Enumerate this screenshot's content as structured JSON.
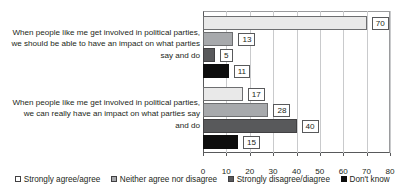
{
  "chart_data": {
    "type": "bar",
    "orientation": "horizontal",
    "title": "",
    "xlabel": "",
    "ylabel": "",
    "xlim": [
      0,
      80
    ],
    "xticks": [
      0,
      10,
      20,
      30,
      40,
      50,
      60,
      70,
      80
    ],
    "grid": true,
    "legend_position": "bottom",
    "categories": [
      "When people like me get involved in political parties, we should be able to have an impact on what parties say and do",
      "When people like me get involved in political parties, we can really have an impact on what parties say and do"
    ],
    "series": [
      {
        "name": "Strongly agree/agree",
        "color": "#e9e9e9",
        "values": [
          70,
          17
        ]
      },
      {
        "name": "Neither agree nor disagree",
        "color": "#a7a9ac",
        "values": [
          13,
          28
        ]
      },
      {
        "name": "Strongly disagree/diagree",
        "color": "#58595b",
        "values": [
          5,
          40
        ]
      },
      {
        "name": "Don't know",
        "color": "#0d0d0d",
        "values": [
          11,
          15
        ]
      }
    ]
  },
  "axis": {
    "tick_labels": [
      "0",
      "10",
      "20",
      "30",
      "40",
      "50",
      "60",
      "70",
      "80"
    ]
  },
  "legend": {
    "items": [
      {
        "label": "Strongly agree/agree",
        "swatch": "legend-swatch-light-gray"
      },
      {
        "label": "Neither agree nor disagree",
        "swatch": "legend-swatch-medium-gray"
      },
      {
        "label": "Strongly disagree/diagree",
        "swatch": "legend-swatch-dark-gray"
      },
      {
        "label": "Don't know",
        "swatch": "legend-swatch-black"
      }
    ]
  },
  "data_labels": {
    "group0": [
      "70",
      "13",
      "5",
      "11"
    ],
    "group1": [
      "17",
      "28",
      "40",
      "15"
    ]
  }
}
